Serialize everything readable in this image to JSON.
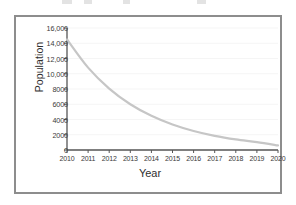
{
  "figure": {
    "border_color": "#8d8d8d",
    "background": "#ffffff"
  },
  "axes": {
    "xlabel": "Year",
    "ylabel": "Population",
    "axis_color": "#555555",
    "tick_color": "#3a3a3a",
    "grid_color": "#f2f2f2"
  },
  "chart_data": {
    "type": "line",
    "title": "",
    "xlabel": "Year",
    "ylabel": "Population",
    "xlim": [
      2010,
      2020
    ],
    "ylim": [
      0,
      16000
    ],
    "grid": true,
    "legend": "none",
    "line_color": "#c6c6c6",
    "line_width": 2.2,
    "xticks": [
      2010,
      2011,
      2012,
      2013,
      2014,
      2015,
      2016,
      2017,
      2018,
      2019,
      2020
    ],
    "xtick_labels": [
      "2010",
      "2011",
      "2012",
      "2013",
      "2014",
      "2015",
      "2016",
      "2017",
      "2018",
      "2019",
      "2020"
    ],
    "yticks": [
      0,
      2000,
      4000,
      6000,
      8000,
      10000,
      12000,
      14000,
      16000
    ],
    "ytick_labels": [
      "0",
      "2000",
      "4000",
      "6000",
      "8000",
      "10,000",
      "12,000",
      "14,000",
      "16,000"
    ],
    "x": [
      2010,
      2011,
      2012,
      2013,
      2014,
      2015,
      2016,
      2017,
      2018,
      2019,
      2020
    ],
    "values": [
      14500,
      10800,
      8050,
      6000,
      4480,
      3340,
      2490,
      1855,
      1385,
      1030,
      600
    ],
    "series": [
      {
        "name": "Population",
        "values": [
          14500,
          10800,
          8050,
          6000,
          4480,
          3340,
          2490,
          1855,
          1385,
          1030,
          600
        ]
      }
    ]
  },
  "artifacts": [
    {
      "left": 62,
      "width": 10
    },
    {
      "left": 84,
      "width": 8
    },
    {
      "left": 123,
      "width": 7
    },
    {
      "left": 197,
      "width": 9
    }
  ]
}
